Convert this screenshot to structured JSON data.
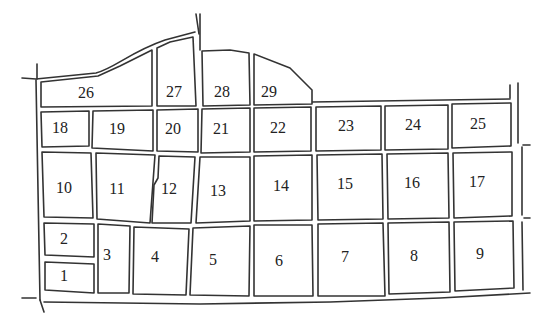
{
  "diagram": {
    "type": "parcel-map",
    "blocks": [
      {
        "id": "1",
        "label": "1",
        "cx": 64,
        "cy": 277,
        "points": "45,262 94,264 94,293 45,290"
      },
      {
        "id": "2",
        "label": "2",
        "cx": 64,
        "cy": 240,
        "points": "44,223 94,224 94,257 45,255"
      },
      {
        "id": "3",
        "label": "3",
        "cx": 107,
        "cy": 256,
        "points": "98,224 130,226 129,293 98,293"
      },
      {
        "id": "4",
        "label": "4",
        "cx": 155,
        "cy": 258,
        "points": "134,227 189,229 186,295 133,294"
      },
      {
        "id": "5",
        "label": "5",
        "cx": 213,
        "cy": 261,
        "points": "193,228 250,226 249,296 190,295"
      },
      {
        "id": "6",
        "label": "6",
        "cx": 279,
        "cy": 262,
        "points": "254,225 312,225 313,296 254,296"
      },
      {
        "id": "7",
        "label": "7",
        "cx": 345,
        "cy": 258,
        "points": "318,224 383,223 385,296 318,296"
      },
      {
        "id": "8",
        "label": "8",
        "cx": 414,
        "cy": 257,
        "points": "388,223 449,222 450,292 389,294"
      },
      {
        "id": "9",
        "label": "9",
        "cx": 480,
        "cy": 255,
        "points": "454,222 513,221 514,288 455,291"
      },
      {
        "id": "10",
        "label": "10",
        "cx": 64,
        "cy": 189,
        "points": "42,152 91,153 93,218 44,217"
      },
      {
        "id": "11",
        "label": "11",
        "cx": 117,
        "cy": 190,
        "points": "96,153 155,155 150,223 97,219"
      },
      {
        "id": "12",
        "label": "12",
        "cx": 169,
        "cy": 190,
        "points": "159,156 195,157 191,223 152,223 154,185 158,178"
      },
      {
        "id": "13",
        "label": "13",
        "cx": 218,
        "cy": 192,
        "points": "200,157 250,157 250,221 196,223"
      },
      {
        "id": "14",
        "label": "14",
        "cx": 281,
        "cy": 187,
        "points": "254,156 312,155 312,220 254,221"
      },
      {
        "id": "15",
        "label": "15",
        "cx": 345,
        "cy": 185,
        "points": "317,155 382,154 383,219 318,220"
      },
      {
        "id": "16",
        "label": "16",
        "cx": 412,
        "cy": 184,
        "points": "387,154 448,153 449,218 388,219"
      },
      {
        "id": "17",
        "label": "17",
        "cx": 477,
        "cy": 183,
        "points": "453,153 512,152 512,216 454,218"
      },
      {
        "id": "18",
        "label": "18",
        "cx": 60,
        "cy": 129,
        "points": "41,112 89,111 89,146 42,147"
      },
      {
        "id": "19",
        "label": "19",
        "cx": 117,
        "cy": 130,
        "points": "93,111 153,110 153,151 92,148"
      },
      {
        "id": "20",
        "label": "20",
        "cx": 173,
        "cy": 130,
        "points": "157,110 198,109 198,152 157,151"
      },
      {
        "id": "21",
        "label": "21",
        "cx": 221,
        "cy": 130,
        "points": "202,109 250,108 250,152 201,153"
      },
      {
        "id": "22",
        "label": "22",
        "cx": 278,
        "cy": 129,
        "points": "254,108 311,107 311,151 254,152"
      },
      {
        "id": "23",
        "label": "23",
        "cx": 346,
        "cy": 127,
        "points": "316,107 381,106 381,150 316,151"
      },
      {
        "id": "24",
        "label": "24",
        "cx": 413,
        "cy": 126,
        "points": "385,106 448,105 448,149 385,150"
      },
      {
        "id": "25",
        "label": "25",
        "cx": 478,
        "cy": 125,
        "points": "452,104 511,103 511,146 452,148"
      },
      {
        "id": "26",
        "label": "26",
        "cx": 86,
        "cy": 94,
        "points": "41,82 98,76 120,66 152,50 152,106 41,107"
      },
      {
        "id": "27",
        "label": "27",
        "cx": 174,
        "cy": 93,
        "points": "157,48 170,42 193,37 196,106 157,106"
      },
      {
        "id": "28",
        "label": "28",
        "cx": 222,
        "cy": 93,
        "points": "202,51 230,50 249,53 250,105 203,106"
      },
      {
        "id": "29",
        "label": "29",
        "cx": 269,
        "cy": 93,
        "points": "254,54 290,68 312,90 312,104 254,105"
      }
    ],
    "roads": [
      {
        "id": "north-curve-outer",
        "d": "M 22,78 L 36,79 L 96,73 C 115,68 130,52 165,40 L 195,32"
      },
      {
        "id": "north-vertical-left-top",
        "d": "M 37,64 L 37,79"
      },
      {
        "id": "west-boundary-outer",
        "d": "M 36,80 L 40,300"
      },
      {
        "id": "west-boundary-outer-2",
        "d": "M 40,300 L 44,312"
      },
      {
        "id": "south-road-west",
        "d": "M 22,298 L 36,298"
      },
      {
        "id": "central-vertical-top",
        "d": "M 196,14 L 199,34"
      },
      {
        "id": "central-vertical-top-2",
        "d": "M 200,14 L 200,50"
      },
      {
        "id": "east-road-vertical",
        "d": "M 518,83 L 518,143"
      },
      {
        "id": "east-road-vertical-2",
        "d": "M 522,147 L 522,215"
      },
      {
        "id": "east-road-vertical-3",
        "d": "M 522,222 L 523,290"
      },
      {
        "id": "east-road-top",
        "d": "M 510,85 L 510,98"
      },
      {
        "id": "south-boundary",
        "d": "M 44,302 L 200,304 L 330,302 L 440,298 L 530,293"
      },
      {
        "id": "east-stub-1",
        "d": "M 523,145 L 530,145"
      },
      {
        "id": "east-stub-2",
        "d": "M 524,218 L 530,218"
      },
      {
        "id": "north-boundary-east",
        "d": "M 312,102 L 510,99"
      }
    ]
  }
}
